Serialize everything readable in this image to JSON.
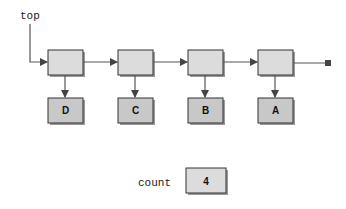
{
  "diagram": {
    "type": "linked-list-stack",
    "pointer_label": "top",
    "nodes": [
      {
        "value": "D"
      },
      {
        "value": "C"
      },
      {
        "value": "B"
      },
      {
        "value": "A"
      }
    ],
    "count_label": "count",
    "count_value": "4",
    "colors": {
      "node_fill": "#dcdcdc",
      "value_fill": "#c8c8c8",
      "stroke": "#333333",
      "shadow": "#9a9a9a",
      "line": "#555555",
      "terminator": "#444444"
    }
  }
}
